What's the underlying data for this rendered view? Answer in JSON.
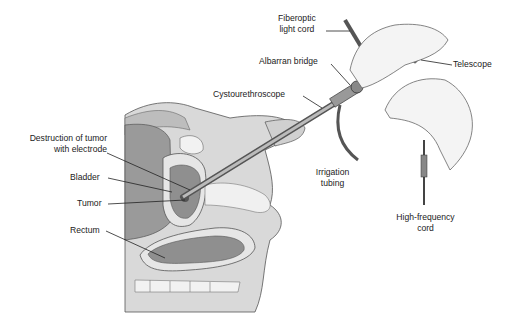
{
  "diagram": {
    "labels": {
      "fiberoptic_1": "Fiberoptic",
      "fiberoptic_2": "light cord",
      "telescope": "Telescope",
      "albarran": "Albarran bridge",
      "cysto": "Cystourethroscope",
      "destruction_1": "Destruction of tumor",
      "destruction_2": "with electrode",
      "bladder": "Bladder",
      "tumor": "Tumor",
      "rectum": "Rectum",
      "irrigation_1": "Irrigation",
      "irrigation_2": "tubing",
      "hf_1": "High-frequency",
      "hf_2": "cord"
    },
    "colors": {
      "skin": "#d9d9d9",
      "organ": "#a9a9a9",
      "dark": "#7d7d7d",
      "line": "#333333",
      "bg": "#ffffff"
    }
  }
}
